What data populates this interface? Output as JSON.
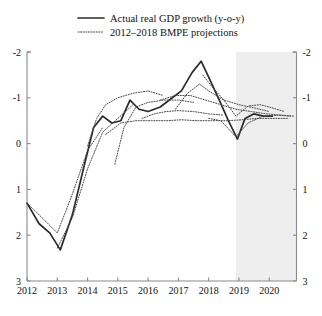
{
  "figure": {
    "background_color": "#ffffff",
    "width": 322,
    "height": 316
  },
  "legend": {
    "position": "top-center",
    "entries": [
      {
        "label": "Actual real GDP growth (y-o-y)",
        "style": "solid",
        "color": "#2b2b2b",
        "name": "legend-actual"
      },
      {
        "label": "2012–2018 BMPE projections",
        "style": "dotted",
        "color": "#4a4a4a",
        "name": "legend-projections"
      }
    ]
  },
  "axes": {
    "y_left_ticks": [
      "3",
      "2",
      "1",
      "0",
      "-1",
      "-2"
    ],
    "y_right_ticks": [
      "3",
      "2",
      "1",
      "0",
      "-1",
      "-2"
    ],
    "x_ticks": [
      "2012",
      "2013",
      "2014",
      "2015",
      "2016",
      "2017",
      "2018",
      "2019",
      "2020"
    ],
    "ylim": [
      -2,
      3
    ],
    "xlim": [
      2012,
      2020.9
    ],
    "grid": "off",
    "y_label": "",
    "x_label": ""
  },
  "shading": {
    "label": "forecast-region",
    "color": "#eeeeee",
    "x_start": 2018.9,
    "x_end": 2020.9
  },
  "chart_data": {
    "type": "line",
    "title": "",
    "subtitle": "",
    "xlabel": "",
    "ylabel": "",
    "xlim": [
      2012,
      2020.9
    ],
    "ylim": [
      -2,
      3
    ],
    "grid": false,
    "legend_position": "top-center",
    "x_tick_labels": [
      "2012",
      "2013",
      "2014",
      "2015",
      "2016",
      "2017",
      "2018",
      "2019",
      "2020"
    ],
    "y_tick_values": [
      -2,
      -1,
      0,
      1,
      2,
      3
    ],
    "shaded_region": {
      "from": 2018.9,
      "to": 2020.9,
      "color": "#eeeeee"
    },
    "series": [
      {
        "name": "Actual real GDP growth (y-o-y)",
        "style": "solid",
        "color": "#2b2b2b",
        "points": [
          [
            2012.0,
            -0.3
          ],
          [
            2012.4,
            -0.75
          ],
          [
            2012.75,
            -0.95
          ],
          [
            2013.1,
            -1.32
          ],
          [
            2013.5,
            -0.55
          ],
          [
            2013.9,
            0.55
          ],
          [
            2014.2,
            1.35
          ],
          [
            2014.5,
            1.6
          ],
          [
            2014.8,
            1.45
          ],
          [
            2015.1,
            1.5
          ],
          [
            2015.4,
            1.95
          ],
          [
            2015.7,
            1.75
          ],
          [
            2016.0,
            1.7
          ],
          [
            2016.4,
            1.8
          ],
          [
            2016.8,
            2.0
          ],
          [
            2017.1,
            2.15
          ],
          [
            2017.45,
            2.55
          ],
          [
            2017.75,
            2.8
          ],
          [
            2018.0,
            2.45
          ],
          [
            2018.35,
            1.95
          ],
          [
            2018.65,
            1.5
          ],
          [
            2018.95,
            1.1
          ],
          [
            2019.2,
            1.55
          ],
          [
            2019.5,
            1.65
          ],
          [
            2019.8,
            1.6
          ],
          [
            2020.1,
            1.6
          ]
        ]
      },
      {
        "name": "2012 BMPE projection",
        "style": "dotted",
        "color": "#4a4a4a",
        "points": [
          [
            2012.0,
            -0.3
          ],
          [
            2012.5,
            -0.62
          ],
          [
            2013.0,
            -0.95
          ],
          [
            2013.5,
            -0.1
          ],
          [
            2014.0,
            0.85
          ],
          [
            2014.5,
            1.35
          ]
        ]
      },
      {
        "name": "2013 BMPE projection",
        "style": "dotted",
        "color": "#4a4a4a",
        "points": [
          [
            2013.0,
            -1.28
          ],
          [
            2013.5,
            -0.62
          ],
          [
            2014.0,
            0.45
          ],
          [
            2014.5,
            1.25
          ],
          [
            2015.0,
            1.55
          ],
          [
            2015.5,
            1.85
          ]
        ]
      },
      {
        "name": "2014 BMPE projection",
        "style": "dotted",
        "color": "#4a4a4a",
        "points": [
          [
            2014.0,
            0.95
          ],
          [
            2014.3,
            1.55
          ],
          [
            2014.6,
            1.85
          ],
          [
            2015.0,
            2.0
          ],
          [
            2015.5,
            2.1
          ],
          [
            2016.0,
            2.15
          ],
          [
            2016.5,
            2.05
          ]
        ]
      },
      {
        "name": "2015 BMPE projection",
        "style": "dotted",
        "color": "#4a4a4a",
        "points": [
          [
            2014.9,
            0.55
          ],
          [
            2015.2,
            1.35
          ],
          [
            2015.6,
            1.8
          ],
          [
            2016.0,
            1.9
          ],
          [
            2016.5,
            1.95
          ],
          [
            2017.0,
            1.95
          ],
          [
            2017.5,
            1.9
          ]
        ]
      },
      {
        "name": "2016 BMPE projection",
        "style": "dotted",
        "color": "#4a4a4a",
        "points": [
          [
            2015.8,
            1.55
          ],
          [
            2016.2,
            1.65
          ],
          [
            2016.6,
            1.7
          ],
          [
            2017.0,
            1.72
          ],
          [
            2017.5,
            1.7
          ],
          [
            2018.0,
            1.65
          ],
          [
            2018.5,
            1.62
          ]
        ]
      },
      {
        "name": "2017 BMPE projection",
        "style": "dotted",
        "color": "#4a4a4a",
        "points": [
          [
            2016.9,
            1.75
          ],
          [
            2017.3,
            2.1
          ],
          [
            2017.7,
            2.3
          ],
          [
            2018.0,
            2.15
          ],
          [
            2018.5,
            1.95
          ],
          [
            2019.0,
            1.85
          ],
          [
            2019.5,
            1.78
          ],
          [
            2020.0,
            1.7
          ]
        ]
      },
      {
        "name": "2018 BMPE projection",
        "style": "dotted",
        "color": "#4a4a4a",
        "points": [
          [
            2017.8,
            2.5
          ],
          [
            2018.1,
            2.25
          ],
          [
            2018.5,
            1.95
          ],
          [
            2018.9,
            1.6
          ],
          [
            2019.3,
            1.82
          ],
          [
            2019.7,
            1.85
          ],
          [
            2020.1,
            1.78
          ],
          [
            2020.5,
            1.7
          ]
        ]
      },
      {
        "name": "2018 BMPE projection (lower)",
        "style": "dotted",
        "color": "#4a4a4a",
        "points": [
          [
            2018.0,
            1.55
          ],
          [
            2018.4,
            1.5
          ],
          [
            2018.9,
            1.15
          ],
          [
            2019.3,
            1.45
          ],
          [
            2019.8,
            1.6
          ],
          [
            2020.3,
            1.62
          ],
          [
            2020.7,
            1.6
          ]
        ]
      },
      {
        "name": "2016 BMPE projection (upper)",
        "style": "dotted",
        "color": "#4a4a4a",
        "points": [
          [
            2016.4,
            1.95
          ],
          [
            2016.9,
            2.05
          ],
          [
            2017.4,
            2.05
          ],
          [
            2017.9,
            1.95
          ],
          [
            2018.4,
            1.85
          ],
          [
            2018.9,
            1.75
          ],
          [
            2019.4,
            1.7
          ],
          [
            2019.9,
            1.65
          ],
          [
            2020.4,
            1.62
          ],
          [
            2020.8,
            1.6
          ]
        ]
      },
      {
        "name": "2015 BMPE projection (low band)",
        "style": "dotted",
        "color": "#4a4a4a",
        "points": [
          [
            2014.6,
            1.2
          ],
          [
            2015.1,
            1.45
          ],
          [
            2015.6,
            1.5
          ],
          [
            2016.1,
            1.5
          ],
          [
            2016.6,
            1.5
          ],
          [
            2017.1,
            1.52
          ],
          [
            2017.6,
            1.5
          ],
          [
            2018.1,
            1.5
          ],
          [
            2018.6,
            1.5
          ],
          [
            2019.1,
            1.52
          ],
          [
            2019.6,
            1.55
          ],
          [
            2020.1,
            1.55
          ],
          [
            2020.6,
            1.55
          ]
        ]
      }
    ]
  }
}
